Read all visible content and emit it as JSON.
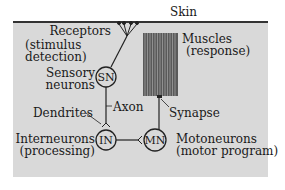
{
  "diagram": {
    "skin_label": "Skin",
    "receptors": {
      "line1": "Receptors",
      "line2": "(stimulus",
      "line3": "detection)"
    },
    "sensory": {
      "line1": "Sensory",
      "line2": "neurons",
      "node": "SN"
    },
    "muscles": {
      "line1": "Muscles",
      "line2": "(response)"
    },
    "axon_label": "Axon",
    "dendrites_label": "Dendrites",
    "synapse_label": "Synapse",
    "interneurons": {
      "line1": "Interneurons",
      "line2": "(processing)",
      "node": "IN"
    },
    "motoneurons": {
      "line1": "Motoneurons",
      "line2": "(motor program)",
      "node": "MN"
    },
    "colors": {
      "panel": "#d9d9d9",
      "line": "#222222",
      "muscle": "#6b6b6b"
    }
  }
}
